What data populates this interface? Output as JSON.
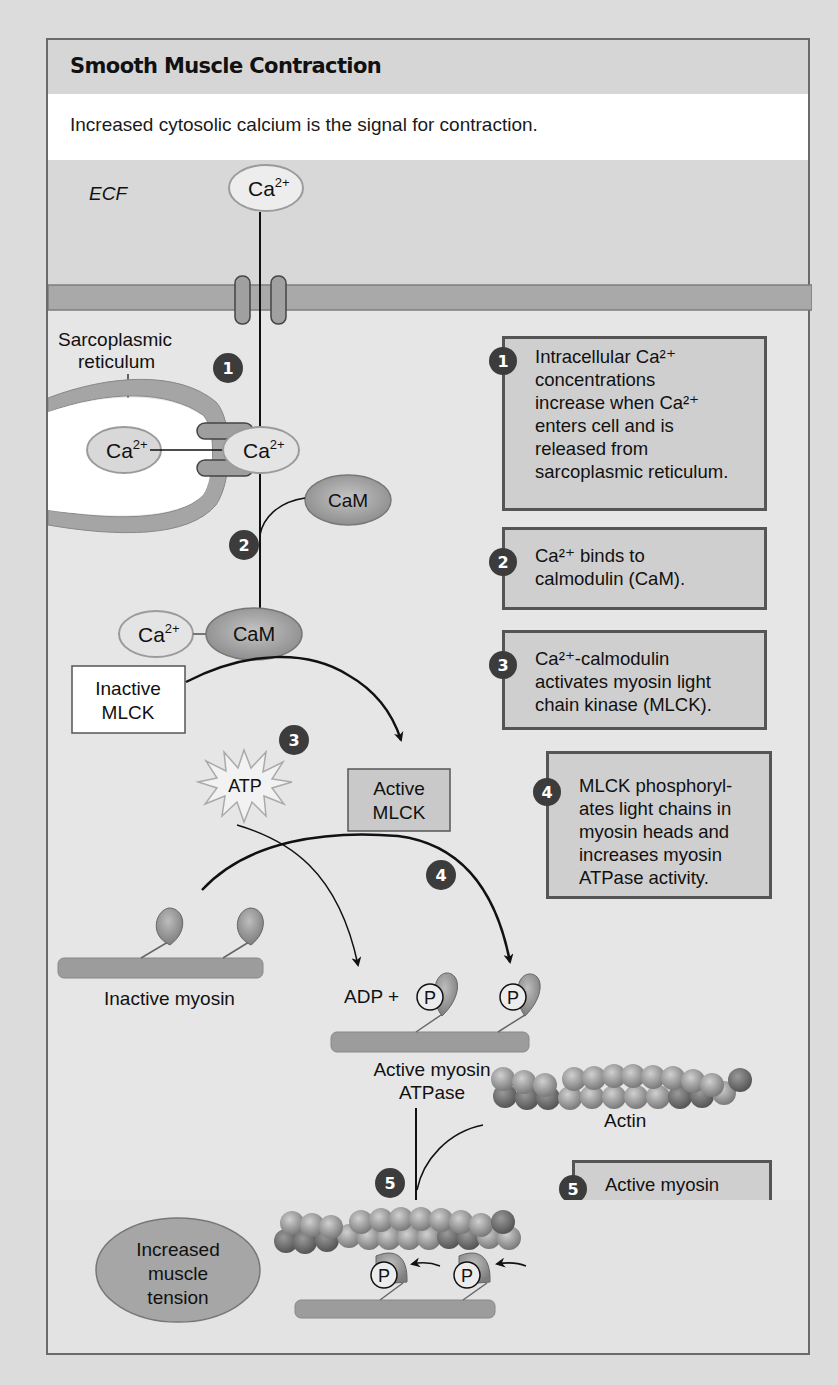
{
  "title": "Smooth Muscle Contraction",
  "subtitle": "Increased cytosolic calcium is the signal for contraction.",
  "labels": {
    "ecf": "ECF",
    "sr_line1": "Sarcoplasmic",
    "sr_line2": "reticulum",
    "ca_base": "Ca",
    "ca_charge": "2+",
    "cam": "CaM",
    "inactive_mlck_1": "Inactive",
    "inactive_mlck_2": "MLCK",
    "active_mlck_1": "Active",
    "active_mlck_2": "MLCK",
    "atp": "ATP",
    "inactive_myosin": "Inactive myosin",
    "adp_plus": "ADP +",
    "phosphate": "P",
    "active_myosin_1": "Active myosin",
    "active_myosin_2": "ATPase",
    "actin": "Actin",
    "tension_1": "Increased",
    "tension_2": "muscle",
    "tension_3": "tension"
  },
  "diagram_badges": [
    "1",
    "2",
    "3",
    "4",
    "5"
  ],
  "steps": [
    {
      "number": "1",
      "lines": [
        "Intracellular Ca²⁺",
        "concentrations",
        "increase when Ca²⁺",
        "enters cell and is",
        "released from",
        "sarcoplasmic reticulum."
      ]
    },
    {
      "number": "2",
      "lines": [
        "Ca²⁺ binds to",
        "calmodulin (CaM)."
      ]
    },
    {
      "number": "3",
      "lines": [
        "Ca²⁺-calmodulin",
        "activates myosin light",
        "chain kinase (MLCK)."
      ]
    },
    {
      "number": "4",
      "lines": [
        "MLCK phosphoryl-",
        "ates light chains in",
        "myosin heads and",
        "increases myosin",
        "ATPase activity."
      ]
    },
    {
      "number": "5",
      "lines": [
        "Active myosin",
        "crossbridges",
        "slide along actin",
        "and create",
        "muscle tension."
      ]
    }
  ],
  "colors": {
    "frame_border": "#6a6a6a",
    "badge": "#3c3c3c",
    "box_fill": "#cfcfcf",
    "membrane": "#a9a9a9",
    "cam": "#9a9a9a"
  }
}
